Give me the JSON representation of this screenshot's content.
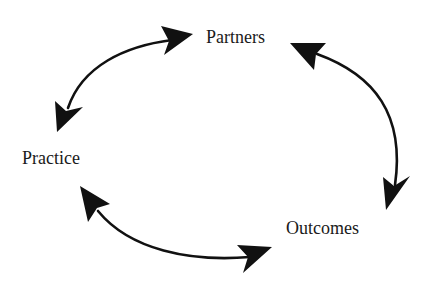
{
  "diagram": {
    "type": "cycle",
    "nodes": [
      {
        "id": "partners",
        "label": "Partners"
      },
      {
        "id": "practice",
        "label": "Practice"
      },
      {
        "id": "outcomes",
        "label": "Outcomes"
      }
    ],
    "edges": [
      {
        "from": "partners",
        "to": "practice",
        "bidirectional": true
      },
      {
        "from": "partners",
        "to": "outcomes",
        "bidirectional": true
      },
      {
        "from": "practice",
        "to": "outcomes",
        "bidirectional": true
      }
    ],
    "colors": {
      "background": "#ffffff",
      "stroke": "#111111",
      "text": "#1a1a1a"
    }
  }
}
